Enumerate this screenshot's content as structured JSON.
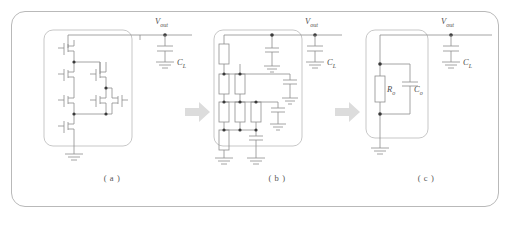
{
  "figure": {
    "panels": [
      {
        "id": "a",
        "caption": "( a )",
        "description": "transistor-level amplifier output stage",
        "node_label": "V",
        "node_sub": "out",
        "load_cap_label": "C",
        "load_cap_sub": "L",
        "elements": {
          "transistors": 6,
          "ground_symbols": 1,
          "load_capacitor": 1
        }
      },
      {
        "id": "b",
        "caption": "( b )",
        "description": "small-signal resistor and capacitor network",
        "node_label": "V",
        "node_sub": "out",
        "load_cap_label": "C",
        "load_cap_sub": "L",
        "elements": {
          "resistors": 7,
          "capacitors": 6,
          "ground_symbols": 3,
          "load_capacitor": 1
        }
      },
      {
        "id": "c",
        "caption": "( c )",
        "description": "simplified output impedance model",
        "node_label": "V",
        "node_sub": "out",
        "load_cap_label": "C",
        "load_cap_sub": "L",
        "resistor_label": "R",
        "resistor_sub": "o",
        "cap_label": "C",
        "cap_sub": "o",
        "elements": {
          "resistors": 1,
          "capacitors": 1,
          "ground_symbols": 1,
          "load_capacitor": 1
        }
      }
    ],
    "arrows": [
      {
        "name": "arrow-a-to-b",
        "direction": "right"
      },
      {
        "name": "arrow-b-to-c",
        "direction": "right"
      }
    ],
    "colors": {
      "frame": "#b9b9b9",
      "wire": "#8e8e8e",
      "node": "#3a3a3a",
      "arrow": "#dcdcdc",
      "text": "#4e4e4e",
      "background": "#ffffff"
    }
  }
}
